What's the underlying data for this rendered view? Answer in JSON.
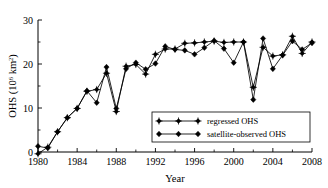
{
  "chart_data": {
    "type": "line",
    "title": "",
    "xlabel": "Year",
    "ylabel": "OHS (10^6 km^2)",
    "ylabel_main": "OHS (10",
    "ylabel_sup1": "6",
    "ylabel_mid": " km",
    "ylabel_sup2": "2",
    "ylabel_end": ")",
    "xlim": [
      1980,
      2008
    ],
    "ylim": [
      0,
      30
    ],
    "xticks": [
      1980,
      1984,
      1988,
      1992,
      1996,
      2000,
      2004,
      2008
    ],
    "xticklabels": [
      "1980",
      "1984",
      "1988",
      "1992",
      "1996",
      "2000",
      "2004",
      "2008"
    ],
    "xminorticks": [
      1982,
      1986,
      1990,
      1994,
      1998,
      2002,
      2006
    ],
    "yticks": [
      0,
      10,
      20,
      30
    ],
    "yticklabels": [
      "0",
      "10",
      "20",
      "30"
    ],
    "yminorticks": [
      5,
      15,
      25
    ],
    "grid": false,
    "legend_position": "lower-right",
    "series": [
      {
        "name": "regressed OHS",
        "marker": "plus-diamond",
        "color": "#000000",
        "x": [
          1980,
          1981,
          1982,
          1983,
          1984,
          1985,
          1986,
          1987,
          1988,
          1989,
          1990,
          1991,
          1992,
          1993,
          1994,
          1995,
          1996,
          1997,
          1998,
          1999,
          2000,
          2001,
          2002,
          2003,
          2004,
          2005,
          2006,
          2007,
          2008
        ],
        "y": [
          -0.4,
          1.1,
          4.6,
          7.8,
          9.9,
          13.8,
          14.2,
          17.9,
          9.2,
          19.5,
          19.9,
          17.7,
          22.2,
          23.4,
          23.4,
          24.7,
          24.8,
          25.0,
          25.2,
          24.9,
          25.0,
          25.0,
          14.7,
          23.8,
          21.8,
          22.1,
          26.3,
          22.4,
          25.0
        ]
      },
      {
        "name": "satellite-observed OHS",
        "marker": "filled-diamond",
        "color": "#000000",
        "x": [
          1980,
          1981,
          1982,
          1983,
          1984,
          1985,
          1986,
          1987,
          1988,
          1989,
          1990,
          1991,
          1992,
          1993,
          1994,
          1995,
          1996,
          1997,
          1998,
          1999,
          2000,
          2001,
          2002,
          2003,
          2004,
          2005,
          2006,
          2007,
          2008
        ],
        "y": [
          1.3,
          0.9,
          4.6,
          7.8,
          9.9,
          13.9,
          11.2,
          19.3,
          9.9,
          18.9,
          20.3,
          18.8,
          20.1,
          24.0,
          23.3,
          23.1,
          22.2,
          23.7,
          25.3,
          23.5,
          20.3,
          25.0,
          11.9,
          25.8,
          18.9,
          22.0,
          25.2,
          23.3,
          24.8
        ]
      }
    ],
    "legend": [
      {
        "label": "regressed OHS",
        "marker": "plus-diamond"
      },
      {
        "label": "satellite-observed OHS",
        "marker": "filled-diamond"
      }
    ]
  }
}
